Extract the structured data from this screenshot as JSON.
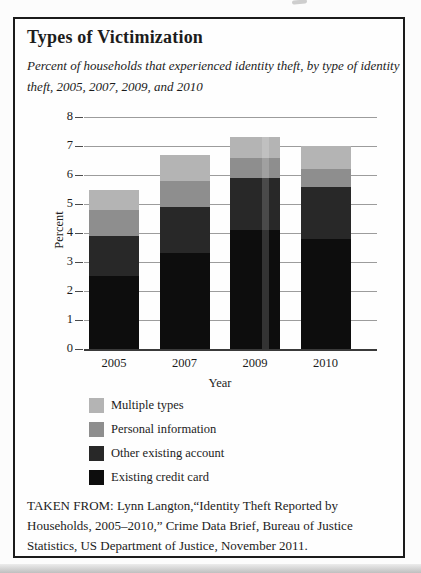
{
  "figure": {
    "title": "Types of Victimization",
    "subtitle_lines": [
      "Percent of households that experienced identity theft, by type of identity",
      "theft, 2005, 2007, 2009, and 2010"
    ],
    "source_lines": [
      "TAKEN FROM: Lynn Langton,“Identity Theft Reported by",
      "Households, 2005–2010,” Crime Data Brief, Bureau of Justice",
      "Statistics, US Department of Justice, November 2011."
    ]
  },
  "chart_data": {
    "type": "bar",
    "stacked": true,
    "title": "Types of Victimization",
    "xlabel": "Year",
    "ylabel": "Percent",
    "ylim": [
      0,
      8
    ],
    "yticks": [
      0,
      1,
      2,
      3,
      4,
      5,
      6,
      7,
      8
    ],
    "grid": true,
    "legend_position": "bottom-left",
    "categories": [
      "2005",
      "2007",
      "2009",
      "2010"
    ],
    "series": [
      {
        "name": "Existing credit card",
        "color": "#0d0d0d",
        "values": [
          2.5,
          3.3,
          4.1,
          3.8
        ]
      },
      {
        "name": "Other existing account",
        "color": "#282828",
        "values": [
          1.4,
          1.6,
          1.8,
          1.8
        ]
      },
      {
        "name": "Personal information",
        "color": "#8e8e8e",
        "values": [
          0.9,
          0.9,
          0.7,
          0.6
        ]
      },
      {
        "name": "Multiple types",
        "color": "#b4b4b4",
        "values": [
          0.7,
          0.9,
          0.7,
          0.8
        ]
      }
    ],
    "totals": [
      5.5,
      6.7,
      7.3,
      7.0
    ],
    "legend_top_to_bottom": [
      "Multiple types",
      "Personal information",
      "Other existing account",
      "Existing credit card"
    ]
  }
}
